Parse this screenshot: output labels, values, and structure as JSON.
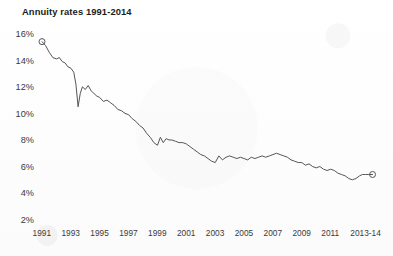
{
  "chart_data": {
    "type": "line",
    "title": "Annuity rates 1991-2014",
    "xlabel": "",
    "ylabel": "",
    "grid": false,
    "legend": false,
    "axis_lines": false,
    "line_color": "#55555a",
    "marker_style": "open-circle-endpoints",
    "ylim": [
      2,
      16
    ],
    "ytick_labels": [
      "16%",
      "14%",
      "12%",
      "10%",
      "8%",
      "6%",
      "4%",
      "2%"
    ],
    "ytick_values": [
      16,
      14,
      12,
      10,
      8,
      6,
      4,
      2
    ],
    "xlim": [
      1991,
      2014
    ],
    "xtick_labels": [
      "1991",
      "1993",
      "1995",
      "1997",
      "1999",
      "2001",
      "2003",
      "2005",
      "2007",
      "2009",
      "2011",
      "2013-14"
    ],
    "xtick_values": [
      1991,
      1993,
      1995,
      1997,
      1999,
      2001,
      2003,
      2005,
      2007,
      2009,
      2011,
      2013.5
    ],
    "series": [
      {
        "name": "Annuity rate",
        "x": [
          1991.0,
          1991.25,
          1991.5,
          1991.75,
          1992.0,
          1992.2,
          1992.4,
          1992.6,
          1992.8,
          1993.0,
          1993.2,
          1993.35,
          1993.5,
          1993.65,
          1993.8,
          1994.0,
          1994.2,
          1994.4,
          1994.6,
          1994.8,
          1995.0,
          1995.25,
          1995.5,
          1995.75,
          1996.0,
          1996.25,
          1996.5,
          1996.75,
          1997.0,
          1997.25,
          1997.5,
          1997.75,
          1998.0,
          1998.25,
          1998.5,
          1998.75,
          1999.0,
          1999.2,
          1999.4,
          1999.6,
          1999.8,
          2000.0,
          2000.25,
          2000.5,
          2000.75,
          2001.0,
          2001.25,
          2001.5,
          2001.75,
          2002.0,
          2002.25,
          2002.5,
          2002.75,
          2003.0,
          2003.25,
          2003.5,
          2003.75,
          2004.0,
          2004.25,
          2004.5,
          2004.75,
          2005.0,
          2005.25,
          2005.5,
          2005.75,
          2006.0,
          2006.25,
          2006.5,
          2006.75,
          2007.0,
          2007.25,
          2007.5,
          2007.75,
          2008.0,
          2008.25,
          2008.5,
          2008.75,
          2009.0,
          2009.25,
          2009.5,
          2009.75,
          2010.0,
          2010.25,
          2010.5,
          2010.75,
          2011.0,
          2011.25,
          2011.5,
          2011.75,
          2012.0,
          2012.25,
          2012.5,
          2012.75,
          2013.0,
          2013.2,
          2013.4,
          2013.6,
          2013.9
        ],
        "y": [
          15.5,
          15.2,
          14.7,
          14.3,
          14.2,
          14.3,
          14.0,
          13.9,
          13.6,
          13.5,
          13.2,
          12.3,
          10.6,
          11.6,
          12.1,
          11.9,
          12.2,
          11.8,
          11.6,
          11.4,
          11.3,
          11.0,
          11.1,
          10.9,
          10.7,
          10.4,
          10.3,
          10.1,
          10.0,
          9.7,
          9.5,
          9.2,
          9.0,
          8.6,
          8.3,
          7.9,
          7.7,
          8.3,
          7.9,
          8.2,
          8.1,
          8.1,
          8.0,
          7.9,
          7.9,
          7.8,
          7.6,
          7.4,
          7.2,
          7.0,
          6.9,
          6.7,
          6.5,
          6.4,
          6.9,
          6.6,
          6.8,
          6.9,
          6.8,
          6.7,
          6.8,
          6.7,
          6.6,
          6.8,
          6.7,
          6.8,
          6.9,
          6.8,
          6.9,
          7.0,
          7.1,
          7.0,
          6.9,
          6.8,
          6.6,
          6.5,
          6.4,
          6.4,
          6.2,
          6.3,
          6.1,
          6.0,
          6.1,
          5.9,
          5.8,
          5.9,
          5.8,
          5.6,
          5.5,
          5.4,
          5.2,
          5.1,
          5.2,
          5.4,
          5.5,
          5.5,
          5.5,
          5.5
        ],
        "start_marker": true,
        "end_marker": true
      }
    ]
  }
}
